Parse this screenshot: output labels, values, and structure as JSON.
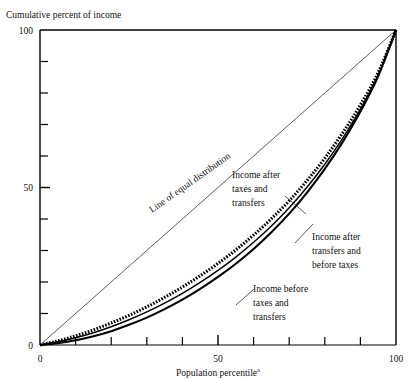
{
  "chart_data": {
    "type": "line",
    "title": "",
    "ylabel": "Cumulative percent of income",
    "xlabel": "Population percentile",
    "xlabel_superscript": "a",
    "xlim": [
      0,
      100
    ],
    "ylim": [
      0,
      100
    ],
    "grid": false,
    "legend_position": "inline-annotations",
    "x_ticks_major": [
      0,
      50,
      100
    ],
    "x_ticks_minor": [
      10,
      20,
      30,
      40,
      60,
      70,
      80,
      90
    ],
    "x_tick_labels": [
      "0",
      "50",
      "100"
    ],
    "y_ticks_major": [
      0,
      50,
      100
    ],
    "y_ticks_minor": [
      10,
      20,
      30,
      40,
      60,
      70,
      80,
      90
    ],
    "y_tick_labels": [
      "0",
      "50",
      "100"
    ],
    "x": [
      0,
      5,
      10,
      15,
      20,
      25,
      30,
      35,
      40,
      45,
      50,
      55,
      60,
      65,
      70,
      75,
      80,
      85,
      90,
      95,
      100
    ],
    "series": [
      {
        "name": "Line of equal distribution",
        "style": "thin-solid",
        "values": [
          0,
          5,
          10,
          15,
          20,
          25,
          30,
          35,
          40,
          45,
          50,
          55,
          60,
          65,
          70,
          75,
          80,
          85,
          90,
          95,
          100
        ]
      },
      {
        "name": "Income after taxes and transfers",
        "style": "dotted-thick",
        "values": [
          0,
          1.3,
          2.9,
          4.8,
          7.0,
          9.4,
          12.1,
          15.1,
          18.4,
          22.0,
          25.9,
          30.2,
          34.9,
          40.1,
          45.8,
          52.2,
          59.3,
          67.3,
          76.2,
          86.5,
          100
        ]
      },
      {
        "name": "Income after transfers and before taxes",
        "style": "solid-medium",
        "values": [
          0,
          1.0,
          2.3,
          3.9,
          5.8,
          8.0,
          10.5,
          13.3,
          16.4,
          19.9,
          23.7,
          27.9,
          32.6,
          37.8,
          43.6,
          50.1,
          57.4,
          65.6,
          74.9,
          85.8,
          100
        ]
      },
      {
        "name": "Income before taxes and transfers",
        "style": "solid-thick",
        "values": [
          0,
          0.6,
          1.5,
          2.8,
          4.4,
          6.4,
          8.7,
          11.4,
          14.4,
          17.8,
          21.6,
          25.8,
          30.5,
          35.8,
          41.7,
          48.4,
          55.9,
          64.4,
          74.1,
          85.4,
          100
        ]
      }
    ],
    "annotations": [
      {
        "id": "equal-distribution",
        "text": "Line of equal distribution",
        "rotated": true,
        "angle": -35
      },
      {
        "id": "after-taxes-transfers",
        "lines": [
          "Income after",
          "taxes and",
          "transfers"
        ]
      },
      {
        "id": "after-transfers-before-taxes",
        "lines": [
          "Income after",
          "transfers and",
          "before taxes"
        ]
      },
      {
        "id": "before-taxes-transfers",
        "lines": [
          "Income before",
          "taxes and",
          "transfers"
        ]
      }
    ],
    "colors": {
      "axis": "#000000",
      "curve": "#000000",
      "equal_line": "#333333",
      "background": "#ffffff"
    }
  }
}
